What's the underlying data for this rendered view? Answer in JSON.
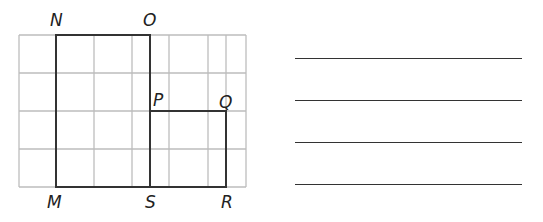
{
  "figure": {
    "grid": {
      "vertical_lines_x": [
        19,
        56,
        94,
        132,
        150,
        169,
        208,
        226,
        246
      ],
      "horizontal_lines_y": [
        35,
        73,
        111,
        149,
        187
      ],
      "left": 19,
      "right": 246,
      "top": 35,
      "bottom": 187,
      "color": "#bdbdbd"
    },
    "shape": {
      "points": "56,35 150,35 150,111 226,111 226,187 56,187",
      "inner_segment": {
        "x1": 150,
        "y1": 111,
        "x2": 150,
        "y2": 187
      },
      "color": "#333333"
    },
    "vertices": [
      {
        "name": "N",
        "x": 50,
        "y": 26
      },
      {
        "name": "O",
        "x": 143,
        "y": 26
      },
      {
        "name": "P",
        "x": 153,
        "y": 106
      },
      {
        "name": "Q",
        "x": 219,
        "y": 108
      },
      {
        "name": "M",
        "x": 47,
        "y": 208
      },
      {
        "name": "S",
        "x": 145,
        "y": 208
      },
      {
        "name": "R",
        "x": 221,
        "y": 208
      }
    ]
  },
  "answer_lines": [
    {
      "y": 58,
      "x1": 295,
      "x2": 522
    },
    {
      "y": 100,
      "x1": 295,
      "x2": 522
    },
    {
      "y": 142,
      "x1": 295,
      "x2": 522
    },
    {
      "y": 184,
      "x1": 295,
      "x2": 522
    }
  ]
}
